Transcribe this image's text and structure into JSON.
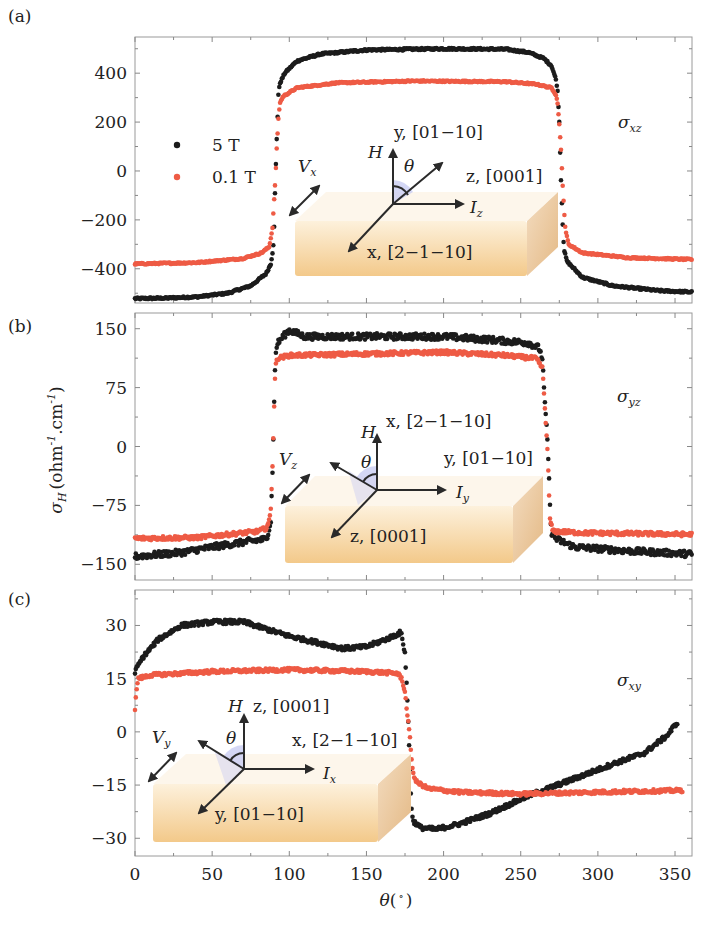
{
  "chart_data": [
    {
      "type": "scatter",
      "panel_label": "(a)",
      "title": "",
      "component_label": "σ_xz",
      "component_symbol": "σ",
      "component_sub": "xz",
      "xlabel": "θ(°)",
      "ylabel": "σ_H (ohm⁻¹.cm⁻¹)",
      "xlim": [
        0,
        361
      ],
      "ylim": [
        -540,
        548
      ],
      "xticks": [
        0,
        50,
        100,
        150,
        200,
        250,
        300,
        350
      ],
      "yticks": [
        -400,
        -200,
        0,
        200,
        400
      ],
      "ytick_labels": [
        "−400",
        "−200",
        "0",
        "200",
        "400"
      ],
      "legend": {
        "position": "upper-left",
        "entries": [
          {
            "label": "5 T",
            "color": "#1c1c1c"
          },
          {
            "label": "0.1 T",
            "color": "#ee5b45"
          }
        ]
      },
      "series": [
        {
          "name": "5 T",
          "color": "#1c1c1c",
          "noise": 4,
          "points": [
            [
              0,
              -522
            ],
            [
              20,
              -520
            ],
            [
              40,
              -515
            ],
            [
              60,
              -500
            ],
            [
              75,
              -470
            ],
            [
              85,
              -420
            ],
            [
              88,
              -380
            ],
            [
              89,
              -340
            ],
            [
              90,
              -280
            ],
            [
              91,
              -30
            ],
            [
              92,
              160
            ],
            [
              93,
              320
            ],
            [
              94,
              360
            ],
            [
              97,
              400
            ],
            [
              105,
              450
            ],
            [
              120,
              478
            ],
            [
              150,
              495
            ],
            [
              200,
              500
            ],
            [
              240,
              498
            ],
            [
              255,
              485
            ],
            [
              265,
              460
            ],
            [
              270,
              430
            ],
            [
              273,
              370
            ],
            [
              274,
              320
            ],
            [
              275,
              200
            ],
            [
              276,
              -20
            ],
            [
              277,
              -190
            ],
            [
              278,
              -320
            ],
            [
              280,
              -370
            ],
            [
              290,
              -435
            ],
            [
              310,
              -470
            ],
            [
              340,
              -490
            ],
            [
              361,
              -495
            ]
          ]
        },
        {
          "name": "0.1 T",
          "color": "#ee5b45",
          "noise": 3,
          "points": [
            [
              0,
              -380
            ],
            [
              40,
              -375
            ],
            [
              70,
              -358
            ],
            [
              82,
              -335
            ],
            [
              87,
              -310
            ],
            [
              89,
              -240
            ],
            [
              90,
              -140
            ],
            [
              91,
              -30
            ],
            [
              92,
              110
            ],
            [
              93,
              220
            ],
            [
              94,
              280
            ],
            [
              96,
              305
            ],
            [
              105,
              340
            ],
            [
              130,
              360
            ],
            [
              180,
              368
            ],
            [
              240,
              365
            ],
            [
              260,
              355
            ],
            [
              270,
              340
            ],
            [
              273,
              310
            ],
            [
              274,
              270
            ],
            [
              275,
              190
            ],
            [
              276,
              100
            ],
            [
              277,
              -40
            ],
            [
              278,
              -150
            ],
            [
              279,
              -240
            ],
            [
              281,
              -300
            ],
            [
              290,
              -335
            ],
            [
              320,
              -355
            ],
            [
              361,
              -362
            ]
          ]
        }
      ]
    },
    {
      "type": "scatter",
      "panel_label": "(b)",
      "title": "",
      "component_label": "σ_yz",
      "component_symbol": "σ",
      "component_sub": "yz",
      "xlabel": "θ(°)",
      "ylabel": "σ_H (ohm⁻¹.cm⁻¹)",
      "xlim": [
        0,
        361
      ],
      "ylim": [
        -170,
        170
      ],
      "xticks": [
        0,
        50,
        100,
        150,
        200,
        250,
        300,
        350
      ],
      "yticks": [
        -150,
        -75,
        0,
        75,
        150
      ],
      "ytick_labels": [
        "−150",
        "−75",
        "0",
        "75",
        "150"
      ],
      "series": [
        {
          "name": "5 T",
          "color": "#1c1c1c",
          "noise": 4,
          "points": [
            [
              0,
              -140
            ],
            [
              30,
              -135
            ],
            [
              50,
              -128
            ],
            [
              70,
              -122
            ],
            [
              85,
              -118
            ],
            [
              86,
              -112
            ],
            [
              88,
              -95
            ],
            [
              89,
              -40
            ],
            [
              90,
              40
            ],
            [
              91,
              115
            ],
            [
              92,
              130
            ],
            [
              95,
              138
            ],
            [
              100,
              148
            ],
            [
              110,
              140
            ],
            [
              150,
              140
            ],
            [
              200,
              140
            ],
            [
              230,
              136
            ],
            [
              255,
              132
            ],
            [
              262,
              125
            ],
            [
              264,
              112
            ],
            [
              265,
              78
            ],
            [
              266,
              42
            ],
            [
              267,
              20
            ],
            [
              268,
              -20
            ],
            [
              269,
              -80
            ],
            [
              270,
              -110
            ],
            [
              273,
              -118
            ],
            [
              285,
              -128
            ],
            [
              320,
              -133
            ],
            [
              361,
              -137
            ]
          ]
        },
        {
          "name": "0.1 T",
          "color": "#ee5b45",
          "noise": 2.5,
          "points": [
            [
              0,
              -117
            ],
            [
              40,
              -116
            ],
            [
              60,
              -112
            ],
            [
              80,
              -108
            ],
            [
              85,
              -104
            ],
            [
              87,
              -95
            ],
            [
              88,
              -80
            ],
            [
              89,
              -30
            ],
            [
              89.5,
              0
            ],
            [
              90,
              40
            ],
            [
              91,
              100
            ],
            [
              92,
              112
            ],
            [
              100,
              116
            ],
            [
              150,
              118
            ],
            [
              200,
              120
            ],
            [
              240,
              116
            ],
            [
              260,
              112
            ],
            [
              264,
              100
            ],
            [
              265,
              72
            ],
            [
              266,
              35
            ],
            [
              267,
              10
            ],
            [
              268,
              -40
            ],
            [
              269,
              -95
            ],
            [
              271,
              -108
            ],
            [
              290,
              -110
            ],
            [
              361,
              -112
            ]
          ]
        }
      ]
    },
    {
      "type": "scatter",
      "panel_label": "(c)",
      "title": "",
      "component_label": "σ_xy",
      "component_symbol": "σ",
      "component_sub": "xy",
      "xlabel": "θ(°)",
      "ylabel": "σ_H (ohm⁻¹.cm⁻¹)",
      "xlim": [
        0,
        361
      ],
      "ylim": [
        -35,
        40
      ],
      "xticks": [
        0,
        50,
        100,
        150,
        200,
        250,
        300,
        350
      ],
      "xtick_labels": [
        "0",
        "50",
        "100",
        "150",
        "200",
        "250",
        "300",
        "350"
      ],
      "yticks": [
        -30,
        -15,
        0,
        15,
        30
      ],
      "ytick_labels": [
        "−30",
        "−15",
        "0",
        "15",
        "30"
      ],
      "series": [
        {
          "name": "5 T",
          "color": "#1c1c1c",
          "noise": 0.6,
          "points": [
            [
              0,
              17
            ],
            [
              5,
              21
            ],
            [
              15,
              26
            ],
            [
              30,
              30
            ],
            [
              50,
              31
            ],
            [
              70,
              31
            ],
            [
              85,
              29
            ],
            [
              100,
              27
            ],
            [
              120,
              25
            ],
            [
              135,
              23.5
            ],
            [
              150,
              24
            ],
            [
              165,
              26.5
            ],
            [
              172,
              28
            ],
            [
              173,
              27
            ],
            [
              175,
              22
            ],
            [
              176,
              14
            ],
            [
              177,
              4
            ],
            [
              178,
              -8
            ],
            [
              179,
              -20
            ],
            [
              180,
              -25
            ],
            [
              185,
              -27
            ],
            [
              195,
              -27.5
            ],
            [
              210,
              -26
            ],
            [
              230,
              -23
            ],
            [
              255,
              -18
            ],
            [
              280,
              -14
            ],
            [
              310,
              -9
            ],
            [
              330,
              -6
            ],
            [
              345,
              -1
            ],
            [
              352,
              3
            ]
          ]
        },
        {
          "name": "0.1 T",
          "color": "#ee5b45",
          "noise": 0.5,
          "points": [
            [
              0,
              6
            ],
            [
              1,
              12
            ],
            [
              2,
              15
            ],
            [
              10,
              16
            ],
            [
              50,
              17
            ],
            [
              100,
              17.5
            ],
            [
              150,
              17
            ],
            [
              170,
              16.5
            ],
            [
              173,
              15
            ],
            [
              175,
              11
            ],
            [
              176,
              7
            ],
            [
              177,
              3
            ],
            [
              178,
              -1
            ],
            [
              179,
              -6
            ],
            [
              180,
              -11
            ],
            [
              182,
              -14
            ],
            [
              190,
              -16
            ],
            [
              210,
              -17
            ],
            [
              250,
              -17.5
            ],
            [
              300,
              -17
            ],
            [
              355,
              -16.5
            ]
          ]
        }
      ]
    }
  ],
  "figure": {
    "panel_labels": [
      "(a)",
      "(b)",
      "(c)"
    ],
    "shared_ylabel_symbol": "σ",
    "shared_ylabel_sub": "H",
    "shared_ylabel_unit": "(ohm",
    "shared_ylabel_sup1": "-1",
    "shared_ylabel_mid": ".cm",
    "shared_ylabel_sup2": "-1",
    "shared_ylabel_close": ")",
    "xlabel_symbol": "θ",
    "xlabel_unit": "(",
    "xlabel_deg": "∘",
    "xlabel_close": ")",
    "legend": {
      "entry1": "5 T",
      "entry2": "0.1 T",
      "color1": "#1c1c1c",
      "color2": "#ee5b45"
    }
  },
  "insets": {
    "a": {
      "voltage": "V",
      "voltage_sub": "x",
      "field": "H",
      "angle": "θ",
      "current": "I",
      "current_sub": "z",
      "axis_up": "y, [01−10]",
      "axis_right": "z, [0001]",
      "axis_diag": "x, [2−1−10]"
    },
    "b": {
      "voltage": "V",
      "voltage_sub": "z",
      "field": "H",
      "angle": "θ",
      "current": "I",
      "current_sub": "y",
      "axis_up": "x, [2−1−10]",
      "axis_right": "y, [01−10]",
      "axis_diag": "z, [0001]"
    },
    "c": {
      "voltage": "V",
      "voltage_sub": "y",
      "field": "H",
      "angle": "θ",
      "current": "I",
      "current_sub": "x",
      "axis_up": "z, [0001]",
      "axis_right": "x, [2−1−10]",
      "axis_diag": "y, [01−10]"
    }
  },
  "colors": {
    "five_tesla": "#1c1c1c",
    "point_one_tesla": "#ee5b45",
    "block_front": "#f7d9a3",
    "block_side": "#e9c48a",
    "angle_fill": "#c9cdf2"
  }
}
